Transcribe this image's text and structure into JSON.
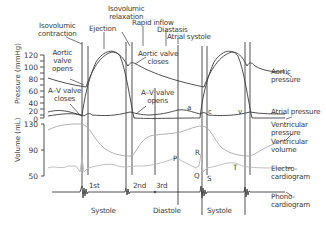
{
  "diagram": {
    "type": "wiggers-cardiac-cycle",
    "phases_top": [
      {
        "label": "Isovolumic\ncontraction"
      },
      {
        "label": "Ejection"
      },
      {
        "label": "Isovolumic\nrelaxation"
      },
      {
        "label": "Rapid inflow"
      },
      {
        "label": "Diastasis"
      },
      {
        "label": "Atrial systole"
      }
    ],
    "annotations": {
      "aortic_valve_opens": "Aortic\nvalve\nopens",
      "aortic_valve_closes": "Aortic valve\ncloses",
      "av_valve_closes": "A–V valve\ncloses",
      "av_valve_opens": "A–V valve\nopens"
    },
    "wave_labels": {
      "a": "a",
      "c": "c",
      "v": "v",
      "p": "P",
      "q": "Q",
      "r": "R",
      "s": "S",
      "t": "T"
    },
    "heart_sounds": [
      "1st",
      "2nd",
      "3rd"
    ],
    "bottom_phases": [
      "Systole",
      "Diastole",
      "Systole"
    ],
    "curve_labels": {
      "aortic_pressure": "Aortic\npressure",
      "atrial_pressure": "Atrial pressure",
      "ventricular_pressure": "Ventricular\npressure",
      "ventricular_volume": "Ventricular\nvolume",
      "ecg": "Electro-\ncardiogram",
      "pcg": "Phono-\ncardiogram"
    },
    "axes": {
      "pressure_label": "Pressure (mmHg)",
      "pressure_ticks": [
        "120",
        "100",
        "80",
        "60",
        "40",
        "20",
        "0"
      ],
      "volume_label": "Volume (mL)",
      "volume_ticks": [
        "130",
        "90",
        "50"
      ]
    },
    "colors": {
      "line": "#3c3c3c",
      "volume": "#a8a8a8",
      "ecg": "#b8b8b8",
      "text": "#3a3a3a"
    }
  }
}
